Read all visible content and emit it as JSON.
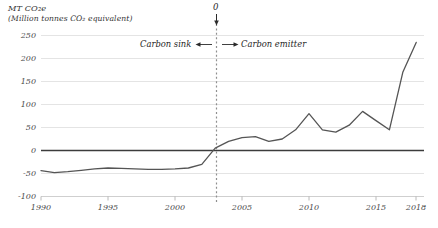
{
  "chart_data": {
    "type": "line",
    "subtitle": "(Million tonnes CO2 equivalent)",
    "title_display": "MT CO₂e",
    "subtitle_display": "(Million tonnes CO₂ equivalent)",
    "xlabel": "",
    "ylabel": "MT CO2e",
    "ylim": [
      -100,
      250
    ],
    "xlim": [
      1990,
      2018
    ],
    "grid": true,
    "legend": "none",
    "yticks": [
      250,
      200,
      150,
      100,
      50,
      0,
      -50,
      -100
    ],
    "ytick_labels": [
      "250",
      "200",
      "150",
      "100",
      "50",
      "0",
      "-50",
      "-100"
    ],
    "xticks": [
      1990,
      1995,
      2000,
      2005,
      2010,
      2015,
      2018
    ],
    "xtick_labels": [
      "1990",
      "1995",
      "2000",
      "2005",
      "2010",
      "2015",
      "2018"
    ],
    "zero_line": 0,
    "x": [
      1990,
      1991,
      1992,
      1993,
      1994,
      1995,
      1996,
      1997,
      1998,
      1999,
      2000,
      2001,
      2002,
      2003,
      2004,
      2005,
      2006,
      2007,
      2008,
      2009,
      2010,
      2011,
      2012,
      2013,
      2014,
      2015,
      2016,
      2017,
      2018
    ],
    "values": [
      -44,
      -48,
      -46,
      -43,
      -40,
      -38,
      -39,
      -40,
      -41,
      -41,
      -40,
      -38,
      -30,
      5,
      20,
      28,
      30,
      20,
      25,
      45,
      80,
      45,
      40,
      55,
      85,
      65,
      45,
      170,
      235
    ],
    "series": [
      {
        "name": "Net emissions",
        "color": "#555555",
        "values": [
          -44,
          -48,
          -46,
          -43,
          -40,
          -38,
          -39,
          -40,
          -41,
          -41,
          -40,
          -38,
          -30,
          5,
          20,
          28,
          30,
          20,
          25,
          45,
          80,
          45,
          40,
          55,
          85,
          65,
          45,
          170,
          235
        ]
      }
    ],
    "annotations": [
      {
        "name": "zero-crossing-label",
        "text": "0",
        "x": 2002.5,
        "y": 250
      },
      {
        "name": "carbon-sink-label",
        "text": "Carbon sink",
        "x": 1998,
        "y": 218
      },
      {
        "name": "carbon-emitter-label",
        "text": "Carbon emitter",
        "x": 2007,
        "y": 218
      }
    ],
    "marker_line": {
      "name": "zero-crossing-line",
      "x": 2002.5,
      "style": "dotted"
    }
  },
  "annotations": {
    "zero_label": "0",
    "sink_label": "Carbon sink",
    "emitter_label": "Carbon emitter",
    "sink_arrow": "←",
    "emitter_arrow": "→"
  },
  "colors": {
    "line": "#555555",
    "grid": "#d6d6d6",
    "zero_axis": "#3a3a3a",
    "dotted_marker": "#8a8a8a",
    "text": "#333333"
  }
}
